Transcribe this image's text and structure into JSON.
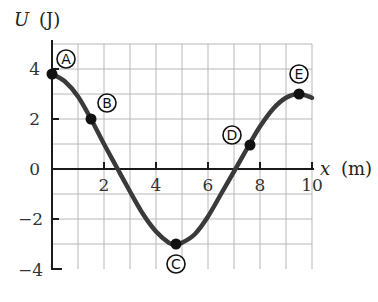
{
  "chart_data": {
    "type": "line",
    "title": "",
    "xlabel": "x (m)",
    "ylabel": "U (J)",
    "xlim": [
      0,
      10
    ],
    "ylim": [
      -4,
      5
    ],
    "grid": true,
    "x_ticks": [
      "2",
      "4",
      "6",
      "8",
      "10"
    ],
    "y_ticks": [
      "4",
      "2",
      "0",
      "−2",
      "−4"
    ],
    "series": [
      {
        "name": "U(x)",
        "x": [
          0,
          0.5,
          1,
          1.5,
          2,
          2.5,
          3,
          3.5,
          4,
          4.5,
          4.75,
          5,
          5.5,
          6,
          6.5,
          7,
          7.6,
          8,
          8.5,
          9,
          9.5,
          10
        ],
        "values": [
          3.8,
          3.5,
          2.9,
          2.0,
          1.0,
          0.05,
          -0.9,
          -1.8,
          -2.5,
          -2.95,
          -3.0,
          -2.95,
          -2.6,
          -1.9,
          -1.0,
          -0.1,
          1.0,
          1.7,
          2.4,
          2.85,
          3.0,
          2.85
        ]
      }
    ],
    "labeled_points": [
      {
        "label": "A",
        "x": 0,
        "y": 3.8
      },
      {
        "label": "B",
        "x": 1.5,
        "y": 2.0
      },
      {
        "label": "C",
        "x": 4.75,
        "y": -3.0
      },
      {
        "label": "D",
        "x": 7.6,
        "y": 1.0
      },
      {
        "label": "E",
        "x": 9.5,
        "y": 3.0
      }
    ]
  },
  "labels": {
    "y_axis_var": "U",
    "y_axis_unit": "(J)",
    "x_axis_var": "x",
    "x_axis_unit": "(m)",
    "tick_x_2": "2",
    "tick_x_4": "4",
    "tick_x_6": "6",
    "tick_x_8": "8",
    "tick_x_10": "10",
    "tick_y_4": "4",
    "tick_y_2": "2",
    "tick_y_0": "0",
    "tick_y_m2": "−2",
    "tick_y_m4": "−4",
    "point_A": "A",
    "point_B": "B",
    "point_C": "C",
    "point_D": "D",
    "point_E": "E"
  }
}
